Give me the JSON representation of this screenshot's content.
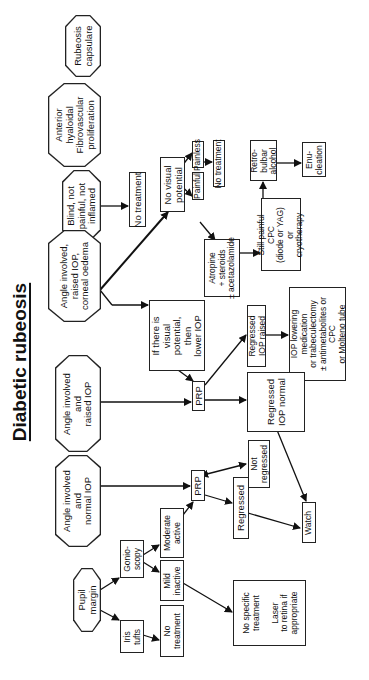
{
  "title": "Diabetic rubeosis",
  "diagram": {
    "orientation": "rotated 90° counter-clockwise",
    "presentations": {
      "rubeosis_capsulare": "Rubeosis\ncapsulare",
      "anterior_hyaloidal": "Anterior\nhyaloidal\nFibrovascular\nproliferation",
      "blind": "Blind, not\npainful, not\ninflamed",
      "corneal_oedema": "Angle involved,\nraised IOP,\ncorneal oedema",
      "raised_iop": "Angle involved\nand\nraised IOP",
      "normal_iop": "Angle involved\nand\nnormal IOP",
      "pupil_margin": "Pupil\nmargin"
    },
    "boxes": {
      "no_treatment_blind": "No treatment",
      "no_visual_potential": "No visual\npotential",
      "painless": "Painless",
      "painful": "Painful",
      "no_treatment_painless": "No treatment",
      "atropine": "Atropine\n+ steroids\n± acetazolamide",
      "still_painful": "Still painful\nCPC\n(diode or YAG)\nor\ncryotherapy",
      "retrobulbar": "Retro-\nbulbar\nalcohol",
      "enucleation": "Enu-\ncleation",
      "visual_potential": "If there is\nvisual\npotential,\nthen\nlower IOP",
      "prp_upper": "PRP",
      "regressed_iop_raised": "Regressed\nIOP raised",
      "iop_lowering": "IOP lowering\nmedication\nor trabeculectomy\n± antimetabolites or\nCPC\nor Molteno tube",
      "regressed_iop_normal": "Regressed\nIOP normal",
      "prp_lower": "PRP",
      "not_regressed": "Not\nregressed",
      "regressed": "Regressed",
      "watch": "Watch",
      "gonioscopy": "Gonio-\nscopy",
      "moderate_active": "Moderate\nactive",
      "mild_inactive": "Mild\ninactive",
      "iris_tufts": "Iris\ntufts",
      "no_treatment_iris": "No\ntreatment",
      "no_specific": "No specific\ntreatment\n\nLaser\nto retina if\nappropriate"
    },
    "edges": [
      [
        "blind",
        "no_treatment_blind"
      ],
      [
        "corneal_oedema",
        "no_visual_potential"
      ],
      [
        "corneal_oedema",
        "visual_potential"
      ],
      [
        "no_visual_potential",
        "painless"
      ],
      [
        "no_visual_potential",
        "painful"
      ],
      [
        "painless",
        "no_treatment_painless"
      ],
      [
        "painful",
        "atropine"
      ],
      [
        "atropine",
        "still_painful"
      ],
      [
        "still_painful",
        "retrobulbar"
      ],
      [
        "retrobulbar",
        "enucleation"
      ],
      [
        "visual_potential",
        "prp_upper"
      ],
      [
        "raised_iop",
        "prp_upper"
      ],
      [
        "prp_upper",
        "regressed_iop_raised"
      ],
      [
        "prp_upper",
        "regressed_iop_normal"
      ],
      [
        "regressed_iop_raised",
        "iop_lowering"
      ],
      [
        "regressed_iop_normal",
        "watch"
      ],
      [
        "normal_iop",
        "prp_lower"
      ],
      [
        "prp_lower",
        "not_regressed"
      ],
      [
        "prp_lower",
        "regressed"
      ],
      [
        "regressed",
        "watch"
      ],
      [
        "pupil_margin",
        "gonioscopy"
      ],
      [
        "pupil_margin",
        "iris_tufts"
      ],
      [
        "gonioscopy",
        "moderate_active"
      ],
      [
        "gonioscopy",
        "mild_inactive"
      ],
      [
        "moderate_active",
        "prp_lower"
      ],
      [
        "mild_inactive",
        "no_specific"
      ],
      [
        "iris_tufts",
        "no_treatment_iris"
      ]
    ],
    "colors": {
      "line": "#222222",
      "background": "#ffffff",
      "text": "#111111"
    }
  }
}
